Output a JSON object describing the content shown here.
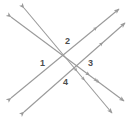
{
  "figure": {
    "kind": "geometry-diagram",
    "background_color": "#ffffff",
    "line_color": "#9a9a9a",
    "label_color": "#4d4d4d",
    "canvas": {
      "width": 130,
      "height": 125
    },
    "angle_labels": [
      {
        "id": "1",
        "text": "1",
        "x": 40,
        "y": 59
      },
      {
        "id": "2",
        "text": "2",
        "x": 65,
        "y": 37
      },
      {
        "id": "3",
        "text": "3",
        "x": 88,
        "y": 59
      },
      {
        "id": "4",
        "text": "4",
        "x": 63,
        "y": 78
      }
    ],
    "lines": [
      {
        "id": "line-a",
        "name": "upper-left-to-lower-right-line-a",
        "direction": "down-right",
        "tick_marks": 2,
        "arrows": "both",
        "x1": 11,
        "y1": 17,
        "x2": 124,
        "y2": 101
      },
      {
        "id": "line-b",
        "name": "upper-left-to-lower-right-line-b",
        "direction": "down-right",
        "tick_marks": 2,
        "arrows": "both",
        "x1": 24,
        "y1": 8,
        "x2": 112,
        "y2": 113
      },
      {
        "id": "line-c",
        "name": "lower-left-to-upper-right-line-c",
        "direction": "up-right",
        "tick_marks": 1,
        "arrows": "both",
        "x1": 11,
        "y1": 98,
        "x2": 119,
        "y2": 9
      },
      {
        "id": "line-d",
        "name": "lower-left-to-upper-right-line-d",
        "direction": "up-right",
        "tick_marks": 1,
        "arrows": "both",
        "x1": 24,
        "y1": 112,
        "x2": 125,
        "y2": 23
      }
    ]
  }
}
